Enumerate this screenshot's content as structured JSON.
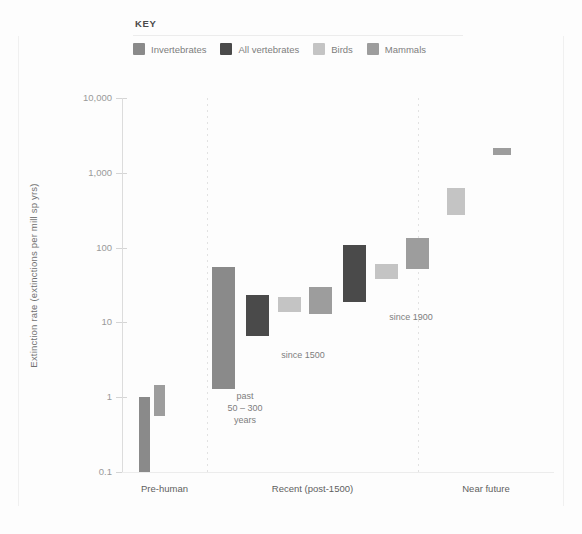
{
  "key": {
    "title": "KEY",
    "items": [
      {
        "label": "Invertebrates",
        "color": "#8a8a8a",
        "name": "invertebrates"
      },
      {
        "label": "All vertebrates",
        "color": "#4a4a4a",
        "name": "all-vertebrates"
      },
      {
        "label": "Birds",
        "color": "#c4c4c4",
        "name": "birds"
      },
      {
        "label": "Mammals",
        "color": "#9d9d9d",
        "name": "mammals"
      }
    ]
  },
  "chart_data": {
    "type": "bar",
    "title": "",
    "subtitle": "",
    "xlabel": "",
    "ylabel": "Extinction rate (extinctions per mill sp yrs)",
    "yscale": "log",
    "ylim": [
      0.1,
      10000
    ],
    "yticks": [
      10000,
      1000,
      100,
      10,
      1,
      0.1
    ],
    "ytick_labels": [
      "10,000",
      "1,000",
      "100",
      "10",
      "1",
      "0.1"
    ],
    "grid": false,
    "legend_position": "top",
    "categories": [
      "Pre-human",
      "Recent (post-1500)",
      "Near future"
    ],
    "series": [
      {
        "name": "Invertebrates",
        "color": "#8a8a8a"
      },
      {
        "name": "All vertebrates",
        "color": "#4a4a4a"
      },
      {
        "name": "Birds",
        "color": "#c4c4c4"
      },
      {
        "name": "Mammals",
        "color": "#9d9d9d"
      }
    ],
    "bars": [
      {
        "group": "Pre-human",
        "series": "Invertebrates",
        "low": 0.1,
        "high": 1.0,
        "x": 0.26,
        "width": 0.13
      },
      {
        "group": "Pre-human",
        "series": "Mammals",
        "low": 0.55,
        "high": 1.45,
        "x": 0.44,
        "width": 0.13
      },
      {
        "group": "Recent (post-1500)",
        "series": "Invertebrates",
        "low": 1.3,
        "high": 55,
        "x": 0.08,
        "width": 0.11
      },
      {
        "group": "Recent (post-1500)",
        "series": "All vertebrates",
        "low": 6.5,
        "high": 23,
        "x": 0.24,
        "width": 0.11
      },
      {
        "group": "Recent (post-1500)",
        "series": "Birds",
        "low": 14,
        "high": 22,
        "x": 0.39,
        "width": 0.11
      },
      {
        "group": "Recent (post-1500)",
        "series": "Mammals",
        "low": 13,
        "high": 30,
        "x": 0.54,
        "width": 0.11
      },
      {
        "group": "Recent (post-1500)",
        "series": "All vertebrates",
        "low": 19,
        "high": 110,
        "x": 0.7,
        "width": 0.11
      },
      {
        "group": "Recent (post-1500)",
        "series": "Birds",
        "low": 38,
        "high": 60,
        "x": 0.85,
        "width": 0.11
      },
      {
        "group": "Recent (post-1500)",
        "series": "Mammals",
        "low": 52,
        "high": 135,
        "x": 1.0,
        "width": 0.11
      },
      {
        "group": "Near future",
        "series": "Birds",
        "low": 270,
        "high": 620,
        "x": 0.28,
        "width": 0.13
      },
      {
        "group": "Near future",
        "series": "Mammals",
        "low": 1750,
        "high": 2150,
        "x": 0.62,
        "width": 0.13
      }
    ],
    "annotations": [
      {
        "text": "past\n50 – 300\nyears",
        "name": "annotation-past-50-300-years"
      },
      {
        "text": "since 1500",
        "name": "annotation-since-1500"
      },
      {
        "text": "since 1900",
        "name": "annotation-since-1900"
      }
    ]
  }
}
